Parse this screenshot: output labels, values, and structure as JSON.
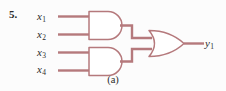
{
  "figure": {
    "problem_number": "5.",
    "caption": "(a)",
    "colors": {
      "wire": "#b5797c",
      "gate_outline": "#b5797c",
      "gate_fill": "#ffffff",
      "text": "#2b2b2b",
      "background": "#fcfcfc"
    }
  },
  "inputs": [
    {
      "name": "x1",
      "base": "x",
      "subscript": "1"
    },
    {
      "name": "x2",
      "base": "x",
      "subscript": "2"
    },
    {
      "name": "x3",
      "base": "x",
      "subscript": "3"
    },
    {
      "name": "x4",
      "base": "x",
      "subscript": "4"
    }
  ],
  "outputs": [
    {
      "name": "y1",
      "base": "y",
      "subscript": "1"
    }
  ],
  "gates": [
    {
      "id": "and-gate-top",
      "type": "AND",
      "inputs": [
        "x1",
        "x2"
      ]
    },
    {
      "id": "and-gate-bottom",
      "type": "AND",
      "inputs": [
        "x3",
        "x4"
      ]
    },
    {
      "id": "or-gate",
      "type": "OR",
      "inputs": [
        "and-gate-top",
        "and-gate-bottom"
      ],
      "output": "y1"
    }
  ],
  "logic": {
    "expression": "y1 = (x1 · x2) + (x3 · x4)"
  }
}
